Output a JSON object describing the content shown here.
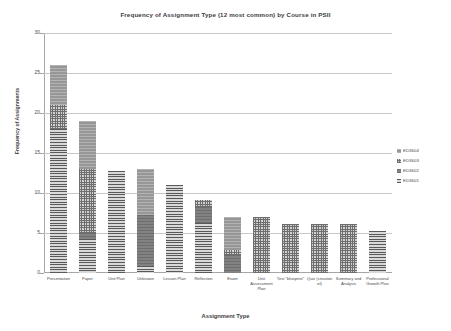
{
  "chart_data": {
    "type": "bar",
    "stacked": true,
    "title": "Frequency of Assignment Type (12 most common) by Course in PSII",
    "xlabel": "Assignment Type",
    "ylabel": "Frequency of Assignments",
    "ylim": [
      0,
      30
    ],
    "yticks": [
      0,
      5,
      10,
      15,
      20,
      25,
      30
    ],
    "grid": "horizontal",
    "legend_position": "right",
    "categories": [
      "Presentation",
      "Paper",
      "Unit Plan",
      "Unknown",
      "Lesson Plan",
      "Reflection",
      "Exam",
      "Unit Assessment Plan",
      "Test \"blueprint\"",
      "Quiz (creation of)",
      "Summary and Analysis",
      "Professional Growth Plan"
    ],
    "series": [
      {
        "name": "ED3601",
        "pattern": "horizontal-lines",
        "color": "#595959",
        "values": [
          18,
          4.2,
          12.8,
          0.9,
          11,
          6.2,
          0,
          0,
          0,
          0,
          0,
          5.3
        ]
      },
      {
        "name": "ED3602",
        "pattern": "solid-dark",
        "color": "#7a7a7a",
        "values": [
          0,
          0.8,
          0,
          6.3,
          0,
          2.0,
          2.3,
          0,
          0,
          0,
          0,
          0
        ]
      },
      {
        "name": "ED3603",
        "pattern": "checkered",
        "color": "#6e6e6e",
        "values": [
          3,
          8,
          0,
          0,
          0,
          0.9,
          0.6,
          7,
          6.1,
          6.1,
          6.1,
          0
        ]
      },
      {
        "name": "ED3604",
        "pattern": "light-solid",
        "color": "#9d9d9d",
        "values": [
          5,
          6,
          0,
          5.8,
          0,
          0,
          4.1,
          0,
          0,
          0,
          0,
          0
        ]
      }
    ],
    "totals": [
      26,
      19,
      12.8,
      13,
      11,
      9.1,
      7,
      7,
      6.1,
      6.1,
      6.1,
      5.3
    ]
  },
  "legend": {
    "entries": [
      {
        "label": "ED3604"
      },
      {
        "label": "ED3603"
      },
      {
        "label": "ED3602"
      },
      {
        "label": "ED3601"
      }
    ]
  }
}
